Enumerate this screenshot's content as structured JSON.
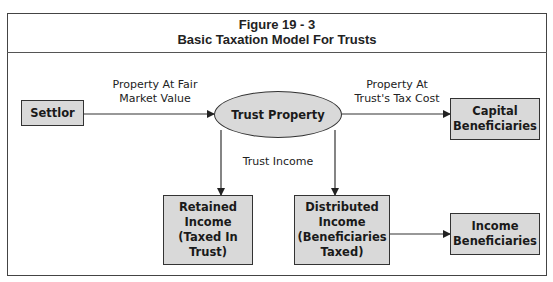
{
  "figure": {
    "number": "Figure 19 - 3",
    "title": "Basic Taxation Model For Trusts"
  },
  "nodes": {
    "settlor": "Settlor",
    "trust_property": "Trust Property",
    "capital_beneficiaries": [
      "Capital",
      "Beneficiaries"
    ],
    "retained_income": [
      "Retained",
      "Income",
      "(Taxed In",
      "Trust)"
    ],
    "distributed_income": [
      "Distributed",
      "Income",
      "(Beneficiaries",
      "Taxed)"
    ],
    "income_beneficiaries": [
      "Income",
      "Beneficiaries"
    ]
  },
  "edges": {
    "settlor_to_trust": [
      "Property At Fair",
      "Market Value"
    ],
    "trust_to_capital": [
      "Property At",
      "Trust's Tax Cost"
    ],
    "trust_income": "Trust Income"
  },
  "colors": {
    "box_fill": "#d9d9d9",
    "stroke": "#333333"
  }
}
